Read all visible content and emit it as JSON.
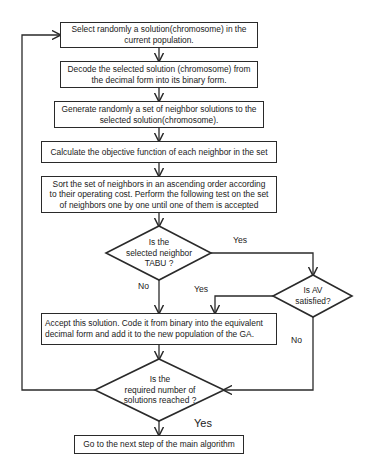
{
  "flowchart": {
    "steps": [
      {
        "id": "select",
        "lines": [
          "Select randomly a solution(chromosome) in the",
          "current population."
        ]
      },
      {
        "id": "decode",
        "lines": [
          "Decode the selected solution (chromosome) from",
          "the decimal form into its binary form."
        ]
      },
      {
        "id": "generate",
        "lines": [
          "Generate randomly a set of neighbor solutions to the",
          "selected  solution(chromosome)."
        ]
      },
      {
        "id": "calculate",
        "lines": [
          "Calculate the objective function of each neighbor in the set"
        ]
      },
      {
        "id": "sort",
        "lines": [
          "Sort the set of neighbors in an ascending order according",
          "to their operating cost. Perform the following test on the set",
          "of neighbors one by one until one of them is accepted"
        ]
      },
      {
        "id": "accept",
        "lines": [
          "Accept this solution. Code it from binary into the equivalent",
          "decimal form and add it to the new population of the GA."
        ]
      },
      {
        "id": "next",
        "lines": [
          "Go to the next step of the main  algorithm"
        ]
      }
    ],
    "decisions": [
      {
        "id": "tabu",
        "lines": [
          "Is  the",
          "selected  neighbor",
          "TABU ?"
        ]
      },
      {
        "id": "av",
        "lines": [
          "Is  AV",
          "satisfied?"
        ]
      },
      {
        "id": "count",
        "lines": [
          "Is  the",
          "required number of",
          "solutions reached ?"
        ]
      }
    ],
    "edge_labels": {
      "tabu_yes": "Yes",
      "tabu_no": "No",
      "av_yes": "Yes",
      "av_no": "No",
      "count_yes": "Yes"
    }
  }
}
